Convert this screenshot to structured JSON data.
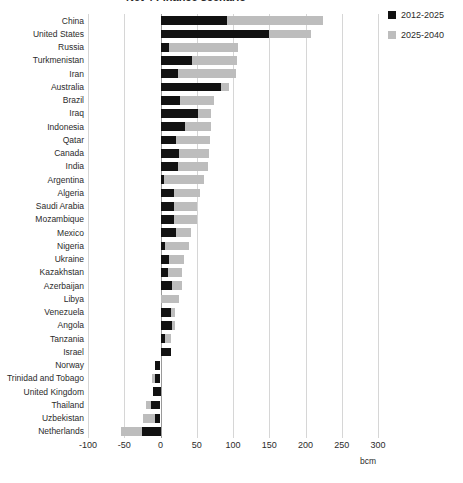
{
  "chart_data": {
    "type": "bar",
    "orientation": "horizontal",
    "title": "Net 4 Finance scenario",
    "xlabel": "bcm",
    "ylabel": "",
    "xlim": [
      -100,
      300
    ],
    "xticks": [
      -100,
      -50,
      0,
      50,
      100,
      150,
      200,
      250,
      300
    ],
    "grid": true,
    "stacked": true,
    "legend_position": "top-right",
    "categories": [
      "China",
      "United States",
      "Russia",
      "Turkmenistan",
      "Iran",
      "Australia",
      "Brazil",
      "Iraq",
      "Indonesia",
      "Qatar",
      "Canada",
      "India",
      "Argentina",
      "Algeria",
      "Saudi Arabia",
      "Mozambique",
      "Mexico",
      "Nigeria",
      "Ukraine",
      "Kazakhstan",
      "Azerbaijan",
      "Libya",
      "Venezuela",
      "Angola",
      "Tanzania",
      "Israel",
      "Norway",
      "Trinidad and Tobago",
      "United Kingdom",
      "Thailand",
      "Uzbekistan",
      "Netherlands"
    ],
    "series": [
      {
        "name": "2012-2025",
        "color": "#111111",
        "values": [
          92,
          150,
          12,
          43,
          24,
          83,
          27,
          52,
          34,
          21,
          26,
          24,
          5,
          19,
          18,
          18,
          22,
          6,
          12,
          11,
          16,
          0,
          14,
          16,
          6,
          14,
          -8,
          -7,
          -10,
          -13,
          -8,
          -25
        ]
      },
      {
        "name": "2025-2040",
        "color": "#bdbdbd",
        "values": [
          132,
          57,
          95,
          62,
          80,
          12,
          47,
          17,
          36,
          47,
          41,
          41,
          55,
          35,
          33,
          32,
          20,
          33,
          20,
          19,
          13,
          26,
          6,
          4,
          9,
          0,
          0,
          -5,
          0,
          -7,
          -16,
          -30
        ]
      }
    ],
    "totals": [
      224,
      207,
      107,
      105,
      104,
      95,
      74,
      69,
      70,
      68,
      67,
      65,
      60,
      54,
      51,
      50,
      42,
      39,
      32,
      30,
      29,
      26,
      20,
      20,
      15,
      14,
      -8,
      -12,
      -10,
      -20,
      -24,
      -55
    ]
  },
  "legend": {
    "items": [
      {
        "label": "2012-2025",
        "swatch": "black"
      },
      {
        "label": "2025-2040",
        "swatch": "gray"
      }
    ]
  }
}
